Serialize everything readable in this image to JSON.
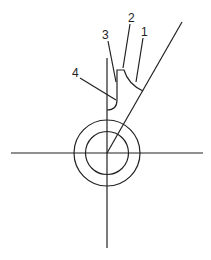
{
  "diagram": {
    "type": "technical line drawing",
    "labels": [
      {
        "id": "1",
        "text": "1",
        "x": 141,
        "y": 26
      },
      {
        "id": "2",
        "text": "2",
        "x": 128,
        "y": 12
      },
      {
        "id": "3",
        "text": "3",
        "x": 102,
        "y": 29
      },
      {
        "id": "4",
        "text": "4",
        "x": 72,
        "y": 67
      }
    ],
    "stroke_color": "#222222",
    "background": "#ffffff"
  }
}
